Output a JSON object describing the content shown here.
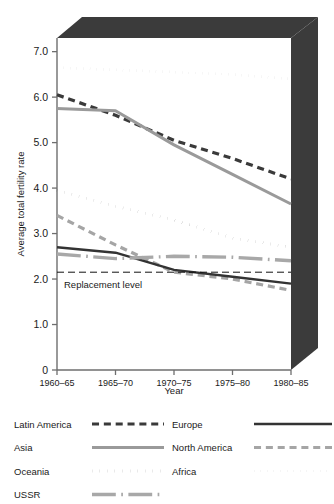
{
  "chart_data": {
    "type": "line",
    "title": "",
    "xlabel": "Year",
    "ylabel": "Average total fertility rate",
    "categories": [
      "1960-65",
      "1965-70",
      "1970-75",
      "1975-80",
      "1980-85"
    ],
    "ylim": [
      0,
      7.3
    ],
    "yticks": [
      "0",
      "1.0",
      "2.0",
      "3.0",
      "4.0",
      "5.0",
      "6.0",
      "7.0"
    ],
    "ytick_values": [
      0,
      1.0,
      2.0,
      3.0,
      4.0,
      5.0,
      6.0,
      7.0
    ],
    "grid": false,
    "legend_position": "below-plot",
    "annotations": [
      {
        "name": "replacement-level",
        "label": "Replacement level",
        "value": 2.15
      }
    ],
    "series": [
      {
        "name": "Africa",
        "values": [
          6.65,
          6.6,
          6.55,
          6.5,
          6.4
        ],
        "style": "dotted",
        "color": "#9a9a9a",
        "width": 2.6
      },
      {
        "name": "Latin America",
        "values": [
          6.05,
          5.6,
          5.05,
          4.65,
          4.2
        ],
        "style": "dashed",
        "color": "#3a3a3a",
        "width": 3.2
      },
      {
        "name": "Asia",
        "values": [
          5.75,
          5.7,
          4.95,
          4.3,
          3.65
        ],
        "style": "solid",
        "color": "#9a9a9a",
        "width": 3.0
      },
      {
        "name": "Oceania",
        "values": [
          3.95,
          3.6,
          3.3,
          2.9,
          2.7
        ],
        "style": "dotted",
        "color": "#2b2b2b",
        "width": 3.0
      },
      {
        "name": "North America",
        "values": [
          3.4,
          2.75,
          2.15,
          2.0,
          1.75
        ],
        "style": "dashed",
        "color": "#a5a5a5",
        "width": 3.2
      },
      {
        "name": "Europe",
        "values": [
          2.7,
          2.58,
          2.2,
          2.05,
          1.9
        ],
        "style": "solid",
        "color": "#333333",
        "width": 2.4
      },
      {
        "name": "USSR",
        "values": [
          2.55,
          2.45,
          2.5,
          2.48,
          2.4
        ],
        "style": "dashdot",
        "color": "#a8a8a8",
        "width": 3.4
      }
    ]
  },
  "legend": {
    "columns": [
      {
        "entries": [
          {
            "label": "Latin America",
            "style": "dashed",
            "color": "#3a3a3a",
            "width": 3.2
          },
          {
            "label": "Asia",
            "style": "solid",
            "color": "#9a9a9a",
            "width": 3.0
          },
          {
            "label": "Oceania",
            "style": "dotted",
            "color": "#2b2b2b",
            "width": 3.0
          },
          {
            "label": "USSR",
            "style": "dashdot",
            "color": "#a8a8a8",
            "width": 3.4
          }
        ]
      },
      {
        "entries": [
          {
            "label": "Europe",
            "style": "solid",
            "color": "#333333",
            "width": 2.6
          },
          {
            "label": "North America",
            "style": "dashed",
            "color": "#a5a5a5",
            "width": 3.2
          },
          {
            "label": "Africa",
            "style": "dotted",
            "color": "#9a9a9a",
            "width": 2.6
          }
        ]
      }
    ]
  },
  "colors": {
    "slab": "#3b3b3b",
    "axis": "#6e6e6e",
    "text": "#1a1a1a",
    "background": "#ffffff"
  }
}
